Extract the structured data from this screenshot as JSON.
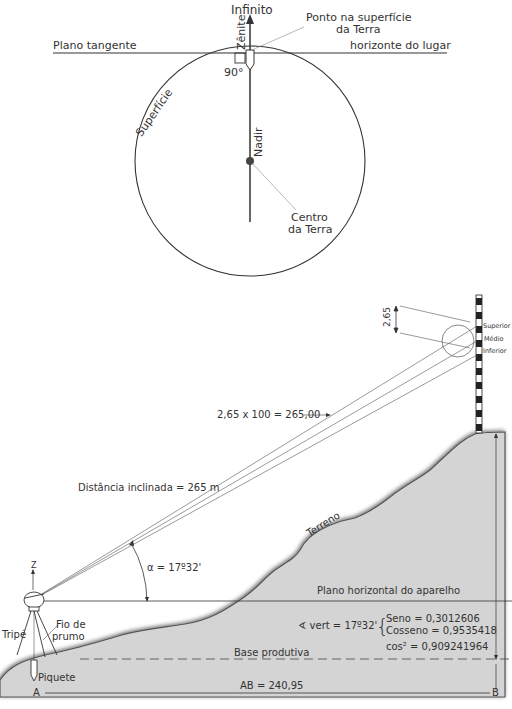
{
  "top_diagram": {
    "infinito": "Infinito",
    "ponto_superficie_line1": "Ponto na superfície",
    "ponto_superficie_line2": "da Terra",
    "plano_tangente": "Plano tangente",
    "horizonte": "horizonte do lugar",
    "zenite": "Zênite",
    "angle_90": "90°",
    "superficie": "Superfície",
    "nadir": "Nadir",
    "centro_line1": "Centro",
    "centro_line2": "da Terra"
  },
  "bottom_diagram": {
    "stadia_reading": "2,65",
    "superior": "Superior",
    "medio": "Médio",
    "inferior": "Inferior",
    "distance_calc": "2,65 x 100 = 265,00",
    "distancia_inclinada": "Distância inclinada = 265 m",
    "terreno": "Terreno",
    "alpha": "α = 17º32'",
    "z_label": "Z",
    "plano_horizontal": "Plano horizontal do aparelho",
    "angle_vert": "∢ vert = 17º32'",
    "seno": "Seno = 0,3012606",
    "cosseno": "Cosseno = 0,9535418",
    "cos2": "cos² = 0,909241964",
    "tripe": "Tripé",
    "fio_de_line1": "Fio de",
    "fio_de_line2": "prumo",
    "base_produtiva": "Base produtiva",
    "piquete": "Piquete",
    "point_a": "A",
    "point_b": "B",
    "ab": "AB = 240,95"
  },
  "colors": {
    "ink": "#333333",
    "terrain_fill": "#d4d4d4",
    "terrain_edge": "#555555"
  }
}
